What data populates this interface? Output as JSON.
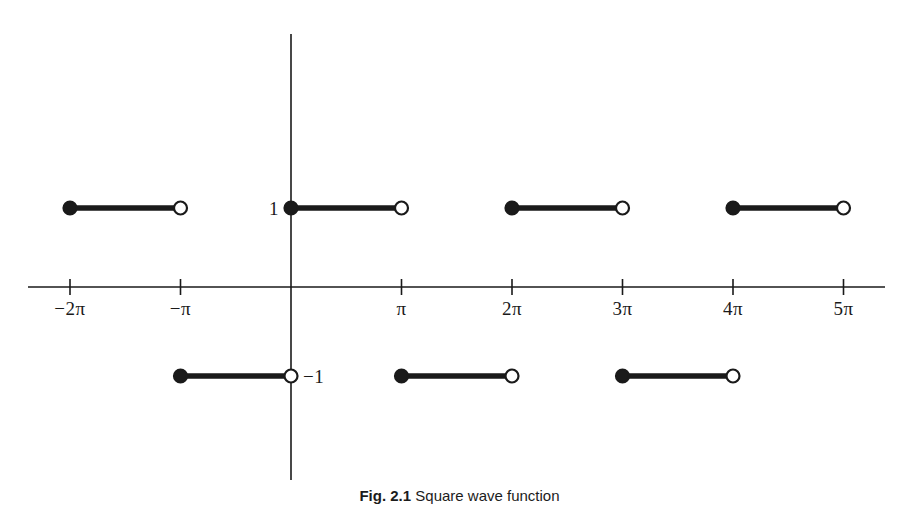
{
  "figure": {
    "caption_label": "Fig. 2.1",
    "caption_text": "Square wave function",
    "background_color": "#ffffff",
    "ink_color": "#1a1a1a"
  },
  "axes": {
    "x_axis_name": "x-axis",
    "y_axis_name": "y-axis",
    "origin_label": "0",
    "x_tick_labels": [
      "−2π",
      "−π",
      "π",
      "2π",
      "3π",
      "4π",
      "5π"
    ],
    "y_value_labels": [
      "1",
      "−1"
    ]
  },
  "chart_data": {
    "type": "line",
    "title": "Square wave function",
    "xlabel": "",
    "ylabel": "",
    "xlim": [
      -2.4,
      5.6
    ],
    "ylim": [
      -1.9,
      2.3
    ],
    "grid": false,
    "legend": "none",
    "x_unit": "pi",
    "x_ticks": [
      -2,
      -1,
      1,
      2,
      3,
      4,
      5
    ],
    "x_tick_labels": [
      "−2π",
      "−π",
      "π",
      "2π",
      "3π",
      "4π",
      "5π"
    ],
    "y_ticks": [
      1,
      -1
    ],
    "y_tick_labels": [
      "1",
      "−1"
    ],
    "segments": [
      {
        "name": "segment-1",
        "x_start": -2,
        "x_end": -1,
        "y": 1,
        "left_endpoint": "closed",
        "right_endpoint": "open"
      },
      {
        "name": "segment-2",
        "x_start": -1,
        "x_end": 0,
        "y": -1,
        "left_endpoint": "closed",
        "right_endpoint": "open"
      },
      {
        "name": "segment-3",
        "x_start": 0,
        "x_end": 1,
        "y": 1,
        "left_endpoint": "closed",
        "right_endpoint": "open"
      },
      {
        "name": "segment-4",
        "x_start": 1,
        "x_end": 2,
        "y": -1,
        "left_endpoint": "closed",
        "right_endpoint": "open"
      },
      {
        "name": "segment-5",
        "x_start": 2,
        "x_end": 3,
        "y": 1,
        "left_endpoint": "closed",
        "right_endpoint": "open"
      },
      {
        "name": "segment-6",
        "x_start": 3,
        "x_end": 4,
        "y": -1,
        "left_endpoint": "closed",
        "right_endpoint": "open"
      },
      {
        "name": "segment-7",
        "x_start": 4,
        "x_end": 5,
        "y": 1,
        "left_endpoint": "closed",
        "right_endpoint": "open"
      }
    ]
  },
  "geometry": {
    "origin_px_x": 291,
    "origin_px_y": 287,
    "pi_px": 110.5,
    "upper_level_px_y": 208,
    "lower_level_px_y": 376,
    "x_axis_start_px": 28,
    "x_axis_end_px": 885,
    "y_axis_top_px": 34,
    "y_axis_bottom_px": 480,
    "tick_half_px": 8,
    "tick_label_px_y": 299,
    "caption_px_y": 487,
    "dot_radius_px": 6.5,
    "segment_stroke_px": 5.5,
    "axis_stroke_px": 1.6
  }
}
